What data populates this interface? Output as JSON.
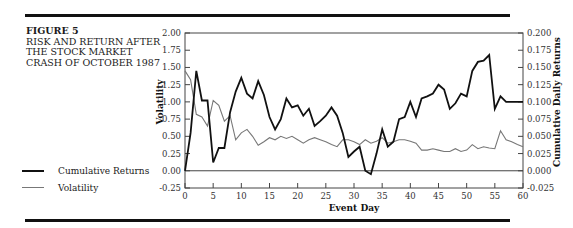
{
  "figure": {
    "label": "FIGURE 5",
    "title": "RISK AND RETURN AFTER THE STOCK MARKET CRASH OF OCTOBER 1987"
  },
  "legend": {
    "items": [
      {
        "label": "Cumulative Returns",
        "style": "thick-black"
      },
      {
        "label": "Volatility",
        "style": "thin-gray"
      }
    ]
  },
  "colors": {
    "returns": "#111111",
    "volatility": "#777777",
    "axis": "#444444"
  },
  "chart_data": {
    "type": "line",
    "title": "Risk and Return After the Stock Market Crash of October 1987",
    "xlabel": "Event Day",
    "ylabel_left": "Volatility",
    "ylabel_right": "Cumulative Daily Returns",
    "xlim": [
      0,
      60
    ],
    "ylim_left": [
      -0.25,
      2.0
    ],
    "ylim_right": [
      -0.025,
      0.2
    ],
    "x_ticks": [
      0,
      5,
      10,
      15,
      20,
      25,
      30,
      35,
      40,
      45,
      50,
      55,
      60
    ],
    "y_ticks_left": [
      "-0.25",
      "0.00",
      "0.25",
      "0.50",
      "0.75",
      "1.00",
      "1.25",
      "1.50",
      "1.75",
      "2.00"
    ],
    "y_ticks_right": [
      "-0.025",
      "0.000",
      "0.025",
      "0.050",
      "0.075",
      "0.100",
      "0.125",
      "0.150",
      "0.175",
      "0.200"
    ],
    "grid": false,
    "legend_position": "left-outside",
    "x": [
      0,
      1,
      2,
      3,
      4,
      5,
      6,
      7,
      8,
      9,
      10,
      11,
      12,
      13,
      14,
      15,
      16,
      17,
      18,
      19,
      20,
      21,
      22,
      23,
      24,
      25,
      26,
      27,
      28,
      29,
      30,
      31,
      32,
      33,
      34,
      35,
      36,
      37,
      38,
      39,
      40,
      41,
      42,
      43,
      44,
      45,
      46,
      47,
      48,
      49,
      50,
      51,
      52,
      53,
      54,
      55,
      56,
      57,
      58,
      59,
      60
    ],
    "series": [
      {
        "name": "Cumulative Returns",
        "axis": "right",
        "values": [
          0.0,
          0.055,
          0.145,
          0.102,
          0.102,
          0.012,
          0.033,
          0.033,
          0.085,
          0.115,
          0.135,
          0.112,
          0.105,
          0.13,
          0.11,
          0.078,
          0.06,
          0.075,
          0.105,
          0.092,
          0.095,
          0.08,
          0.09,
          0.065,
          0.072,
          0.08,
          0.092,
          0.08,
          0.055,
          0.02,
          0.028,
          0.035,
          0.0,
          -0.005,
          0.025,
          0.06,
          0.035,
          0.042,
          0.075,
          0.078,
          0.1,
          0.078,
          0.105,
          0.108,
          0.112,
          0.125,
          0.118,
          0.09,
          0.098,
          0.112,
          0.108,
          0.145,
          0.158,
          0.16,
          0.168,
          0.09,
          0.108,
          0.1,
          0.1,
          0.1,
          0.1
        ]
      },
      {
        "name": "Volatility",
        "axis": "left",
        "values": [
          1.45,
          1.32,
          0.82,
          0.78,
          0.65,
          1.02,
          0.95,
          0.72,
          0.8,
          0.45,
          0.55,
          0.6,
          0.5,
          0.37,
          0.42,
          0.48,
          0.45,
          0.5,
          0.47,
          0.5,
          0.45,
          0.4,
          0.45,
          0.48,
          0.45,
          0.42,
          0.38,
          0.35,
          0.45,
          0.45,
          0.42,
          0.38,
          0.45,
          0.4,
          0.43,
          0.48,
          0.4,
          0.42,
          0.45,
          0.45,
          0.43,
          0.4,
          0.3,
          0.3,
          0.32,
          0.3,
          0.28,
          0.28,
          0.32,
          0.28,
          0.3,
          0.38,
          0.32,
          0.35,
          0.33,
          0.32,
          0.58,
          0.45,
          0.42,
          0.38,
          0.35
        ]
      }
    ]
  }
}
